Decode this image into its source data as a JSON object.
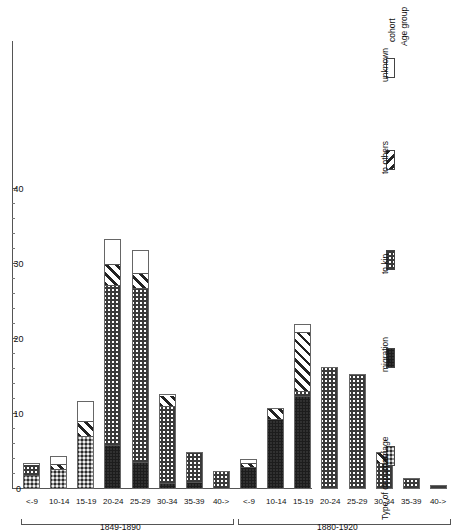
{
  "chart_data": {
    "type": "bar",
    "orientation": "horizontal-rotated",
    "title": "",
    "xlabel": "Age group",
    "ylabel": "",
    "ylim": [
      0,
      40
    ],
    "ticks": [
      0,
      10,
      20,
      30,
      40
    ],
    "tick_labels": [
      "0",
      "10",
      "20",
      "30",
      "40"
    ],
    "grid": false,
    "legend_title": "Type of departure",
    "legend_position": "right",
    "cohort_label": "cohort",
    "age_group_label": "Age group",
    "series": [
      {
        "name": "marriage",
        "pattern": "dark-checker"
      },
      {
        "name": "migration",
        "pattern": "dark-dots"
      },
      {
        "name": "to kin",
        "pattern": "light-checker"
      },
      {
        "name": "to others",
        "pattern": "diagonal-stripes"
      },
      {
        "name": "unknown",
        "pattern": "white"
      }
    ],
    "categories": [
      "<-9",
      "10-14",
      "15-19",
      "20-24",
      "25-29",
      "30-34",
      "35-39",
      "40->"
    ],
    "cohorts": [
      {
        "label": "1849-1890",
        "groups": [
          {
            "age": "<-9",
            "marriage": 1.8,
            "migration": 0.0,
            "to_kin": 1.6,
            "to_others": 0.0,
            "unknown": 0.0
          },
          {
            "age": "10-14",
            "marriage": 2.6,
            "migration": 0.0,
            "to_kin": 0.0,
            "to_others": 0.7,
            "unknown": 1.1
          },
          {
            "age": "15-19",
            "marriage": 7.0,
            "migration": 0.0,
            "to_kin": 0.0,
            "to_others": 2.0,
            "unknown": 2.7
          },
          {
            "age": "20-24",
            "marriage": 0.0,
            "migration": 5.7,
            "to_kin": 21.5,
            "to_others": 2.8,
            "unknown": 3.3
          },
          {
            "age": "25-29",
            "marriage": 0.0,
            "migration": 3.3,
            "to_kin": 23.4,
            "to_others": 2.1,
            "unknown": 3.1
          },
          {
            "age": "30-34",
            "marriage": 0.0,
            "migration": 0.6,
            "to_kin": 10.4,
            "to_others": 1.6,
            "unknown": 0.0
          },
          {
            "age": "35-39",
            "marriage": 0.0,
            "migration": 0.7,
            "to_kin": 4.2,
            "to_others": 0.0,
            "unknown": 0.0
          },
          {
            "age": "40->",
            "marriage": 0.0,
            "migration": 0.0,
            "to_kin": 2.4,
            "to_others": 0.0,
            "unknown": 0.0
          }
        ]
      },
      {
        "label": "1880-1920",
        "groups": [
          {
            "age": "<-9",
            "marriage": 0.0,
            "migration": 2.8,
            "to_kin": 0.0,
            "to_others": 0.7,
            "unknown": 0.5
          },
          {
            "age": "10-14",
            "marriage": 0.0,
            "migration": 9.3,
            "to_kin": 0.0,
            "to_others": 1.5,
            "unknown": 0.0
          },
          {
            "age": "15-19",
            "marriage": 0.0,
            "migration": 12.3,
            "to_kin": 0.6,
            "to_others": 8.0,
            "unknown": 1.1
          },
          {
            "age": "20-24",
            "marriage": 0.0,
            "migration": 0.0,
            "to_kin": 16.3,
            "to_others": 0.0,
            "unknown": 0.0
          },
          {
            "age": "25-29",
            "marriage": 0.0,
            "migration": 0.0,
            "to_kin": 15.3,
            "to_others": 0.0,
            "unknown": 0.0
          },
          {
            "age": "30-34",
            "marriage": 0.0,
            "migration": 0.0,
            "to_kin": 3.4,
            "to_others": 1.5,
            "unknown": 0.0
          },
          {
            "age": "35-39",
            "marriage": 0.0,
            "migration": 0.0,
            "to_kin": 1.5,
            "to_others": 0.0,
            "unknown": 0.0
          },
          {
            "age": "40->",
            "marriage": 0.0,
            "migration": 0.0,
            "to_kin": 0.5,
            "to_others": 0.0,
            "unknown": 0.0
          }
        ]
      }
    ]
  }
}
